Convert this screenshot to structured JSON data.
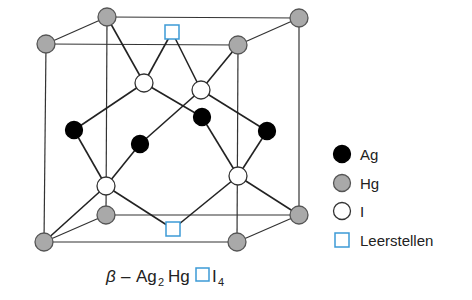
{
  "formula": {
    "prefix": "β",
    "dash": "–",
    "ag": "Ag",
    "ag_sub": "2",
    "hg": "Hg",
    "i": "I",
    "i_sub": "4"
  },
  "legend": [
    {
      "key": "Ag",
      "label": "Ag",
      "marker": "filled-circle",
      "fill": "#000000",
      "stroke": "#000000"
    },
    {
      "key": "Hg",
      "label": "Hg",
      "marker": "gray-circle",
      "fill": "#a9a9a9",
      "stroke": "#555555"
    },
    {
      "key": "I",
      "label": "I",
      "marker": "open-circle",
      "fill": "#ffffff",
      "stroke": "#333333"
    },
    {
      "key": "vacancy",
      "label": "Leerstellen",
      "marker": "open-square",
      "fill": "#ffffff",
      "stroke": "#3c9ad6"
    }
  ],
  "colors": {
    "ag": "#000000",
    "hg": "#a9a9a9",
    "hg_stroke": "#555555",
    "i": "#ffffff",
    "i_stroke": "#333333",
    "vacancy": "#3c9ad6",
    "line": "#333333"
  }
}
